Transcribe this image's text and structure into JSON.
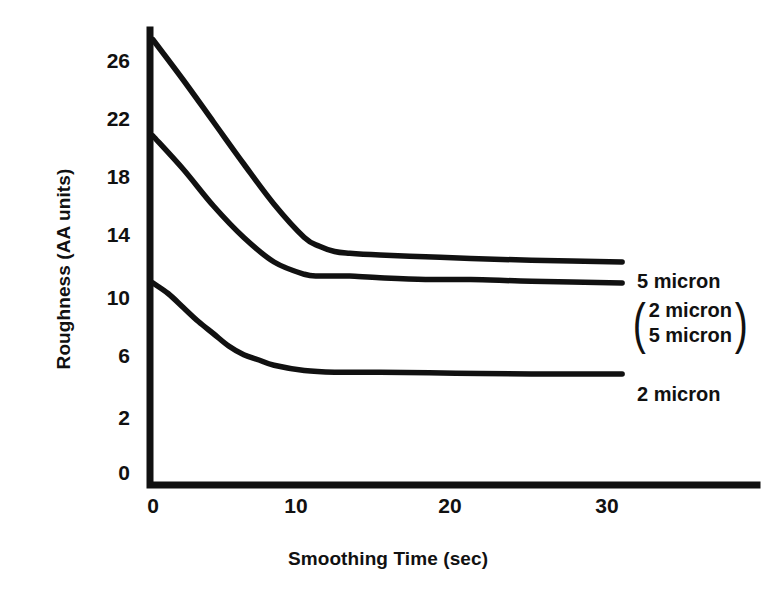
{
  "chart_data": {
    "type": "line",
    "title": "",
    "xlabel": "Smoothing Time (sec)",
    "ylabel": "Roughness (AA units)",
    "xlim": [
      0,
      41
    ],
    "ylim": [
      0,
      28
    ],
    "xticks": [
      0,
      10,
      20,
      30
    ],
    "yticks": [
      0,
      2,
      6,
      10,
      14,
      18,
      22,
      26
    ],
    "grid": false,
    "legend_position": "right-inline",
    "series": [
      {
        "name": "5 micron",
        "label": "5 micron",
        "x": [
          0,
          2,
          4,
          6,
          8,
          10,
          11,
          12,
          13,
          15,
          18,
          21,
          25,
          31
        ],
        "y": [
          24.7,
          22.4,
          20.0,
          17.6,
          15.3,
          13.4,
          12.9,
          12.6,
          12.5,
          12.4,
          12.3,
          12.2,
          12.1,
          12.0
        ]
      },
      {
        "name": "2 micron / 5 micron",
        "label_line1": "2 micron",
        "label_line2": "5 micron",
        "x": [
          0,
          2,
          4,
          6,
          8,
          10,
          11,
          12,
          13,
          15,
          18,
          21,
          25,
          31
        ],
        "y": [
          19.2,
          17.3,
          15.2,
          13.4,
          12.0,
          11.3,
          11.2,
          11.2,
          11.2,
          11.1,
          11.0,
          11.0,
          10.9,
          10.8
        ]
      },
      {
        "name": "2 micron",
        "label": "2 micron",
        "x": [
          0,
          1,
          2,
          3,
          4,
          5,
          6,
          7,
          8,
          10,
          12,
          15,
          20,
          25,
          31
        ],
        "y": [
          10.8,
          10.2,
          9.4,
          8.6,
          7.9,
          7.2,
          6.7,
          6.4,
          6.1,
          5.8,
          5.7,
          5.7,
          5.65,
          5.6,
          5.6
        ]
      }
    ]
  },
  "axis": {
    "y_tick_labels": [
      "26",
      "22",
      "18",
      "14",
      "10",
      "6",
      "2",
      "0"
    ],
    "x_tick_labels": [
      "0",
      "10",
      "20",
      "30"
    ],
    "y_title": "Roughness (AA units)",
    "x_title": "Smoothing Time (sec)"
  },
  "annotations": {
    "top_label": "5 micron",
    "group_line1": "2 micron",
    "group_line2": "5 micron",
    "group_open_paren": "(",
    "group_close_paren": ")",
    "bottom_label": "2 micron"
  },
  "colors": {
    "ink": "#111111",
    "background": "#ffffff"
  }
}
